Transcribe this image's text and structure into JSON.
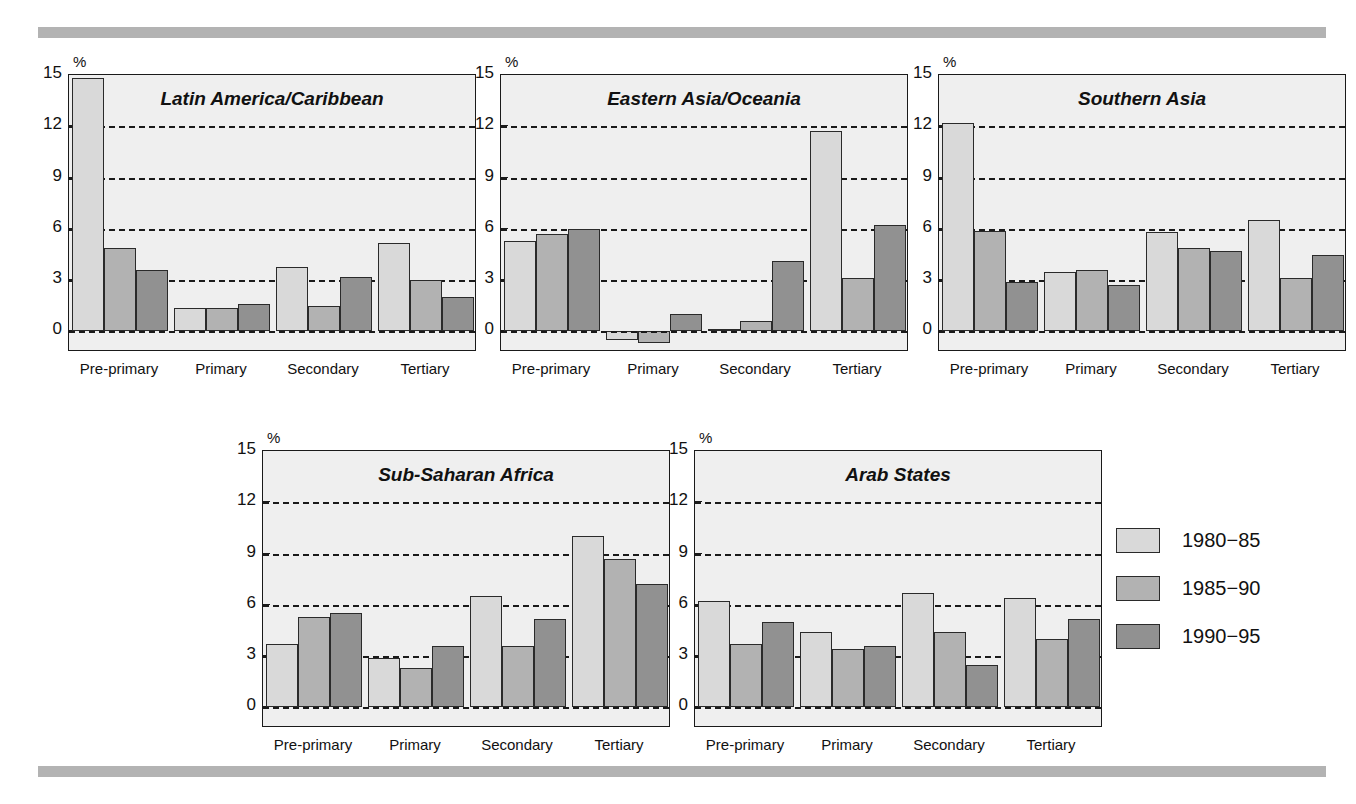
{
  "figure": {
    "top_cut_text": "",
    "rule_color": "#b3b3b3"
  },
  "axis": {
    "unit_label": "%",
    "ticks": [
      "15",
      "12",
      "9",
      "6",
      "3",
      "0"
    ],
    "categories": [
      "Pre-primary",
      "Primary",
      "Secondary",
      "Tertiary"
    ]
  },
  "legend": {
    "items": [
      {
        "label": "1980−85",
        "color": "#d9d9d9"
      },
      {
        "label": "1985−90",
        "color": "#b2b2b2"
      },
      {
        "label": "1990−95",
        "color": "#919191"
      }
    ]
  },
  "chart_data": [
    {
      "type": "bar",
      "title": "Latin America/Caribbean",
      "xlabel": "",
      "ylabel": "%",
      "ylim": [
        -1.2,
        15
      ],
      "yticks": [
        0,
        3,
        6,
        9,
        12,
        15
      ],
      "grid": true,
      "legend_position": "outside-right",
      "categories": [
        "Pre-primary",
        "Primary",
        "Secondary",
        "Tertiary"
      ],
      "series": [
        {
          "name": "1980−85",
          "values": [
            14.8,
            1.4,
            3.8,
            5.2
          ]
        },
        {
          "name": "1985−90",
          "values": [
            4.9,
            1.4,
            1.5,
            3.0
          ]
        },
        {
          "name": "1990−95",
          "values": [
            3.6,
            1.6,
            3.2,
            2.0
          ]
        }
      ]
    },
    {
      "type": "bar",
      "title": "Eastern Asia/Oceania",
      "xlabel": "",
      "ylabel": "%",
      "ylim": [
        -1.2,
        15
      ],
      "yticks": [
        0,
        3,
        6,
        9,
        12,
        15
      ],
      "grid": true,
      "legend_position": "outside-right",
      "categories": [
        "Pre-primary",
        "Primary",
        "Secondary",
        "Tertiary"
      ],
      "series": [
        {
          "name": "1980−85",
          "values": [
            5.3,
            -0.5,
            0.15,
            11.7
          ]
        },
        {
          "name": "1985−90",
          "values": [
            5.7,
            -0.7,
            0.6,
            3.1
          ]
        },
        {
          "name": "1990−95",
          "values": [
            6.0,
            1.0,
            4.1,
            6.2
          ]
        }
      ]
    },
    {
      "type": "bar",
      "title": "Southern Asia",
      "xlabel": "",
      "ylabel": "%",
      "ylim": [
        -1.2,
        15
      ],
      "yticks": [
        0,
        3,
        6,
        9,
        12,
        15
      ],
      "grid": true,
      "legend_position": "outside-right",
      "categories": [
        "Pre-primary",
        "Primary",
        "Secondary",
        "Tertiary"
      ],
      "series": [
        {
          "name": "1980−85",
          "values": [
            12.2,
            3.5,
            5.8,
            6.5
          ]
        },
        {
          "name": "1985−90",
          "values": [
            5.9,
            3.6,
            4.9,
            3.1
          ]
        },
        {
          "name": "1990−95",
          "values": [
            2.9,
            2.7,
            4.7,
            4.5
          ]
        }
      ]
    },
    {
      "type": "bar",
      "title": "Sub-Saharan Africa",
      "xlabel": "",
      "ylabel": "%",
      "ylim": [
        -1.2,
        15
      ],
      "yticks": [
        0,
        3,
        6,
        9,
        12,
        15
      ],
      "grid": true,
      "legend_position": "outside-right",
      "categories": [
        "Pre-primary",
        "Primary",
        "Secondary",
        "Tertiary"
      ],
      "series": [
        {
          "name": "1980−85",
          "values": [
            3.7,
            2.9,
            6.5,
            10.0
          ]
        },
        {
          "name": "1985−90",
          "values": [
            5.3,
            2.3,
            3.6,
            8.7
          ]
        },
        {
          "name": "1990−95",
          "values": [
            5.5,
            3.6,
            5.2,
            7.2
          ]
        }
      ]
    },
    {
      "type": "bar",
      "title": "Arab States",
      "xlabel": "",
      "ylabel": "%",
      "ylim": [
        -1.2,
        15
      ],
      "yticks": [
        0,
        3,
        6,
        9,
        12,
        15
      ],
      "grid": true,
      "legend_position": "outside-right",
      "categories": [
        "Pre-primary",
        "Primary",
        "Secondary",
        "Tertiary"
      ],
      "series": [
        {
          "name": "1980−85",
          "values": [
            6.2,
            4.4,
            6.7,
            6.4
          ]
        },
        {
          "name": "1985−90",
          "values": [
            3.7,
            3.4,
            4.4,
            4.0
          ]
        },
        {
          "name": "1990−95",
          "values": [
            5.0,
            3.6,
            2.5,
            5.2
          ]
        }
      ]
    }
  ],
  "layout": {
    "panels": [
      {
        "left": 40,
        "top": 74,
        "plot_w": 408,
        "plot_h": 277
      },
      {
        "left": 472,
        "top": 74,
        "plot_w": 408,
        "plot_h": 277
      },
      {
        "left": 910,
        "top": 74,
        "plot_w": 408,
        "plot_h": 277
      },
      {
        "left": 234,
        "top": 450,
        "plot_w": 408,
        "plot_h": 277
      },
      {
        "left": 666,
        "top": 450,
        "plot_w": 408,
        "plot_h": 277
      }
    ],
    "legend": {
      "left": 1116,
      "top": 528
    }
  }
}
